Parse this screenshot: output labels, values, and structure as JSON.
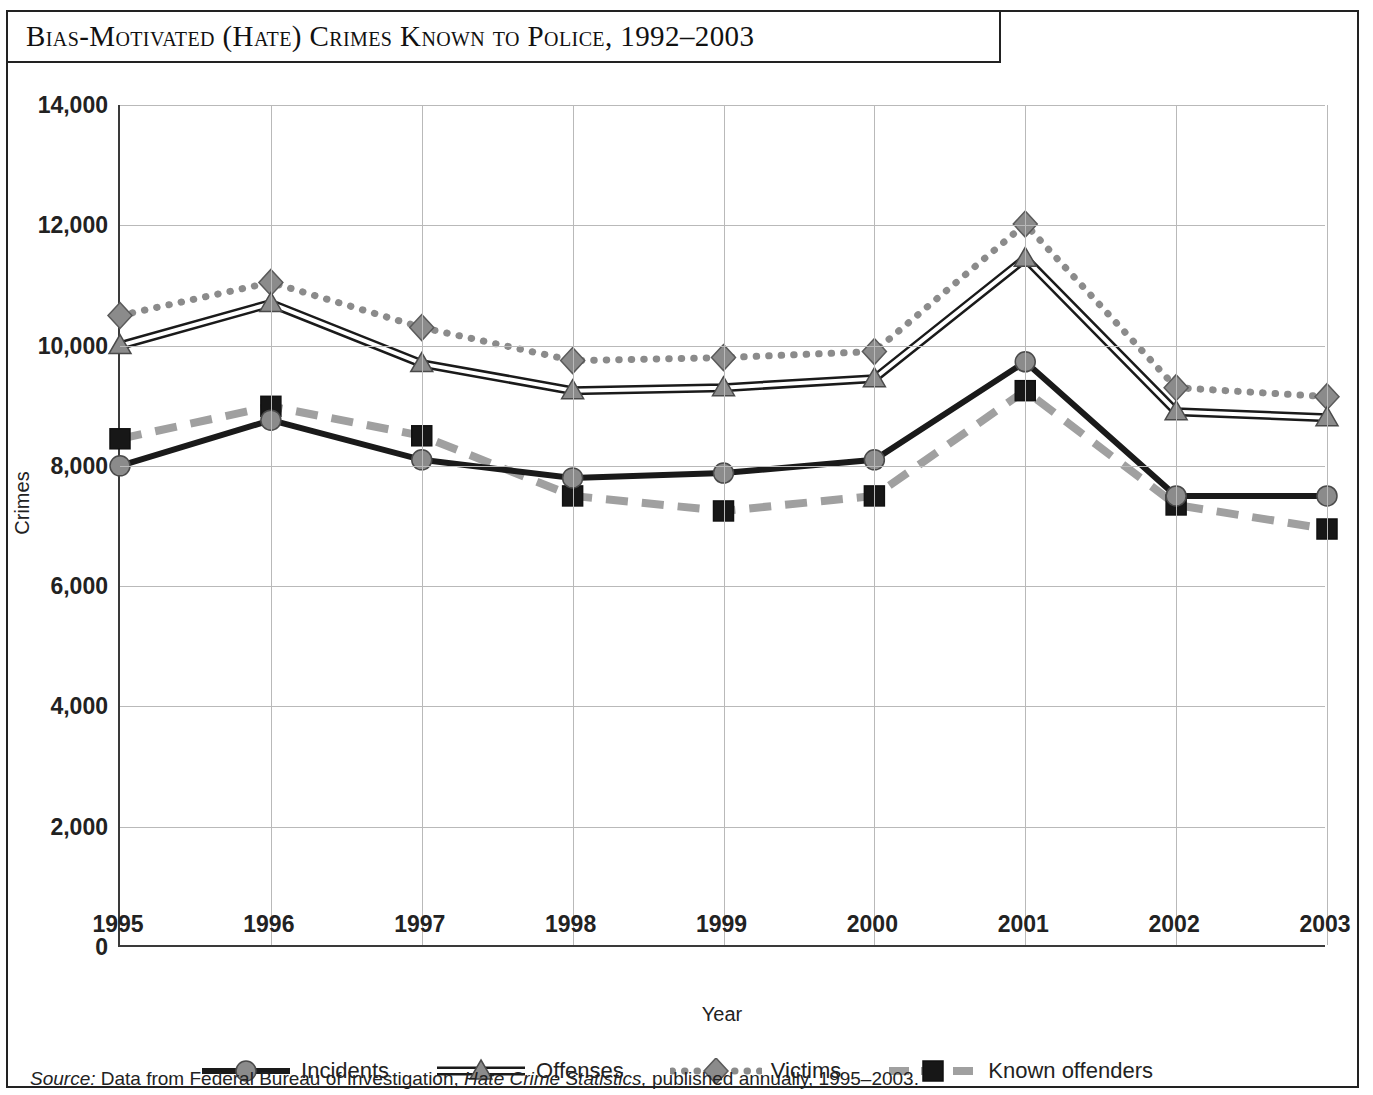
{
  "figure": {
    "title": "Bias-Motivated (Hate) Crimes Known to Police, 1992–2003",
    "source_prefix": "Source:",
    "source_part1": " Data from Federal Bureau of Investigation, ",
    "source_italic": "Hate Crime Statistics,",
    "source_part2": " published annually, 1995–2003."
  },
  "chart_data": {
    "type": "line",
    "title": "Bias-Motivated (Hate) Crimes Known to Police, 1992–2003",
    "xlabel": "Year",
    "ylabel": "Crimes",
    "categories": [
      "1995",
      "1996",
      "1997",
      "1998",
      "1999",
      "2000",
      "2001",
      "2002",
      "2003"
    ],
    "x": [
      1995,
      1996,
      1997,
      1998,
      1999,
      2000,
      2001,
      2002,
      2003
    ],
    "ylim": [
      0,
      14000
    ],
    "ytick_labels": [
      "0",
      "2,000",
      "4,000",
      "6,000",
      "8,000",
      "10,000",
      "12,000",
      "14,000"
    ],
    "yticks": [
      0,
      2000,
      4000,
      6000,
      8000,
      10000,
      12000,
      14000
    ],
    "grid": "both",
    "legend_position": "bottom",
    "series": [
      {
        "name": "Incidents",
        "style": "solid-thick-black",
        "marker": "circle",
        "color": "#1a1a1a",
        "marker_color": "#8b8b8b",
        "values": [
          8000,
          8760,
          8100,
          7800,
          7880,
          8100,
          9730,
          7500,
          7500
        ]
      },
      {
        "name": "Offenses",
        "style": "double-line",
        "marker": "triangle",
        "color": "#1a1a1a",
        "marker_color": "#8b8b8b",
        "values": [
          10000,
          10700,
          9700,
          9250,
          9300,
          9450,
          11450,
          8900,
          8800
        ]
      },
      {
        "name": "Victims",
        "style": "dotted-gray",
        "marker": "diamond",
        "color": "#8b8b8b",
        "marker_color": "#8b8b8b",
        "values": [
          10500,
          11050,
          10300,
          9750,
          9800,
          9900,
          12020,
          9300,
          9150
        ]
      },
      {
        "name": "Known offenders",
        "style": "dashed-thick-gray",
        "marker": "square",
        "color": "#a0a0a0",
        "marker_color": "#171717",
        "values": [
          8450,
          8990,
          8500,
          7500,
          7250,
          7500,
          9250,
          7350,
          6950
        ]
      }
    ]
  },
  "colors": {
    "frame": "#222222",
    "grid": "#b9b9b9",
    "axis": "#3a3a3a",
    "gray_series": "#8b8b8b",
    "dark_series": "#1a1a1a"
  }
}
